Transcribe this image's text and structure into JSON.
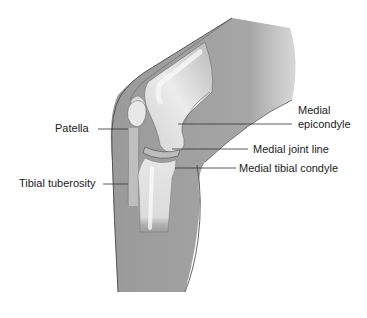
{
  "figure": {
    "colors": {
      "skin": "#9e9e9e",
      "skin_light": "#b8b8b8",
      "bone": "#d6d6d6",
      "bone_highlight": "#f2f2f2",
      "outline": "#555555",
      "leader": "#333333",
      "text": "#222222"
    }
  },
  "labels": {
    "patella": "Patella",
    "tibial_tuberosity": "Tibial tuberosity",
    "medial_epicondyle_line1": "Medial",
    "medial_epicondyle_line2": "epicondyle",
    "medial_joint_line": "Medial joint line",
    "medial_tibial_condyle": "Medial tibial condyle"
  }
}
